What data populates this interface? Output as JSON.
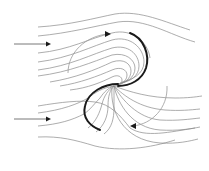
{
  "diagram": {
    "type": "streamline flow diagram",
    "center": {
      "x": 114,
      "y": 85
    },
    "colors": {
      "background": "#ffffff",
      "streamline": "#8a8a8a",
      "blade": "#1a1a1a",
      "rotation_arrow": "#9a9a9a",
      "arrowhead": "#1a1a1a"
    },
    "inflow_arrows": [
      {
        "name": "upper-inflow-arrow",
        "x1": 14,
        "x2": 50,
        "y": 44,
        "direction": "right"
      },
      {
        "name": "lower-inflow-arrow",
        "x1": 14,
        "x2": 50,
        "y": 119,
        "direction": "right"
      }
    ],
    "rotation_arrows": [
      {
        "name": "upper-rotation-arrow",
        "direction": "clockwise",
        "position": "upper-left"
      },
      {
        "name": "lower-rotation-arrow",
        "direction": "clockwise",
        "position": "lower-right"
      }
    ],
    "blades": [
      {
        "name": "upper-right-blade"
      },
      {
        "name": "lower-left-blade"
      }
    ]
  }
}
